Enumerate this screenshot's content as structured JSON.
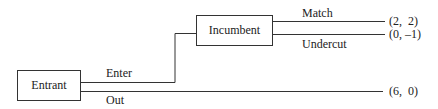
{
  "diagram": {
    "type": "game-tree",
    "nodes": {
      "entrant": "Entrant",
      "incumbent": "Incumbent"
    },
    "edges": {
      "enter": "Enter",
      "out": "Out",
      "match": "Match",
      "undercut": "Undercut"
    },
    "payoffs": {
      "match": "(2,  2)",
      "undercut": "(0, –1)",
      "out": "(6,  0)"
    }
  }
}
